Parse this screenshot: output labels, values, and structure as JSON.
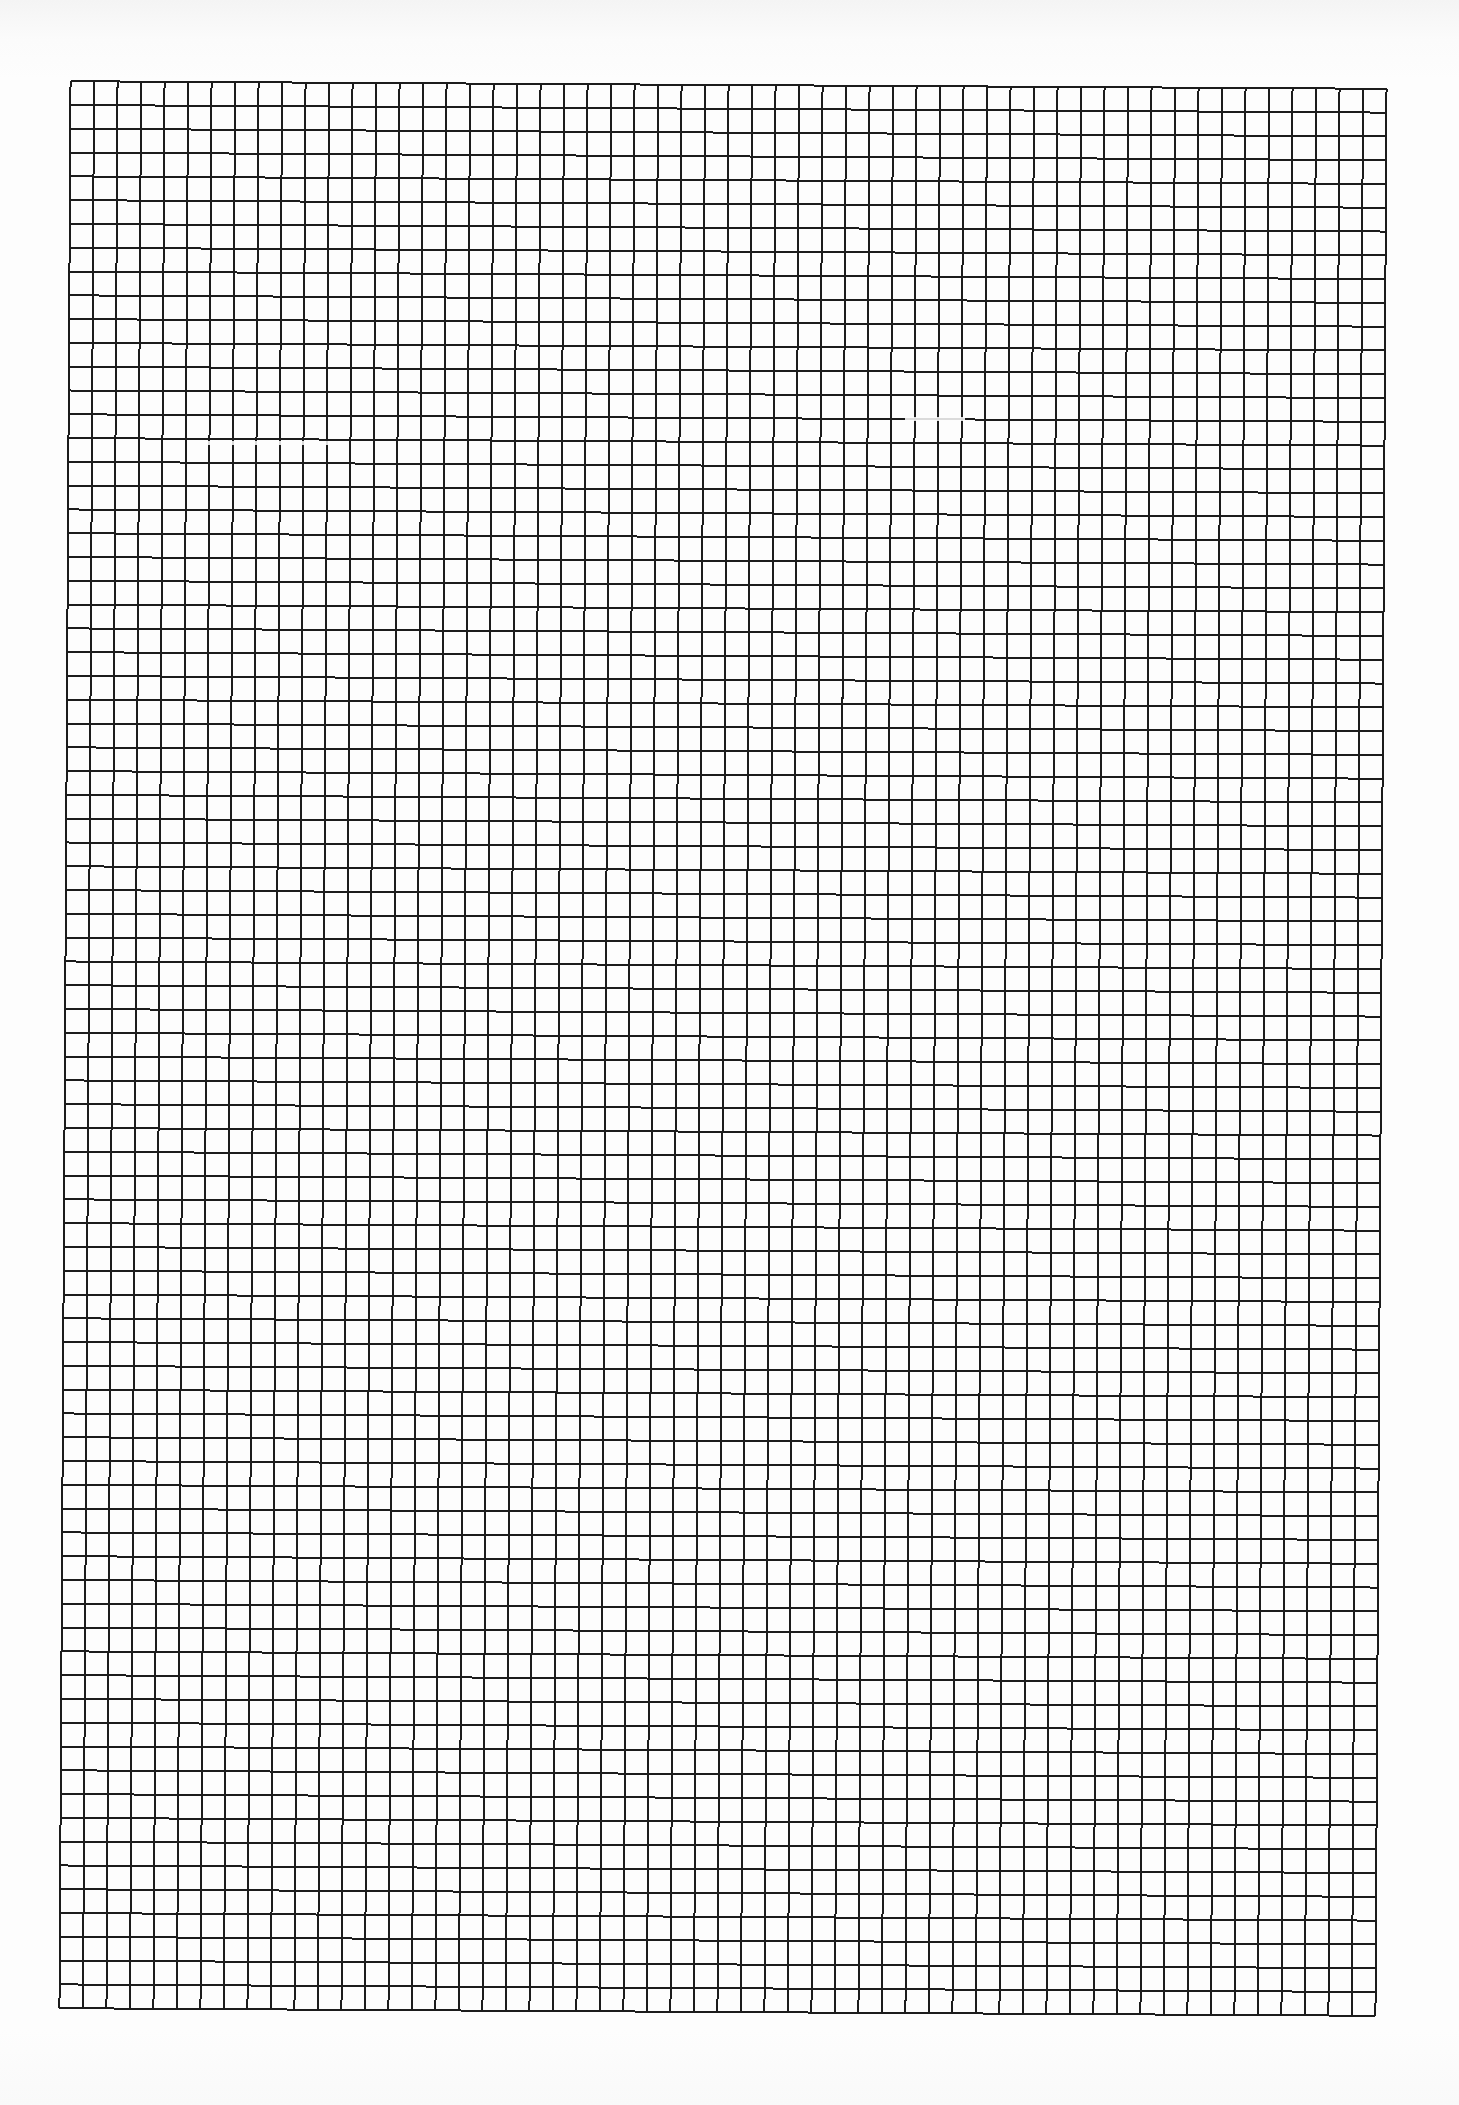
{
  "page": {
    "type": "graph-paper",
    "background_color": "#fdfdfd",
    "line_color": "#1c1c1c",
    "line_width_px": 2
  },
  "grid": {
    "columns": 56,
    "rows": 81,
    "origin_x": 65,
    "origin_y": 85,
    "width": 1316,
    "height": 1927,
    "rotation_deg": 0.33
  },
  "artifacts": [
    {
      "x": 200,
      "y": 443,
      "width": 130
    },
    {
      "x": 905,
      "y": 419,
      "width": 60
    }
  ]
}
